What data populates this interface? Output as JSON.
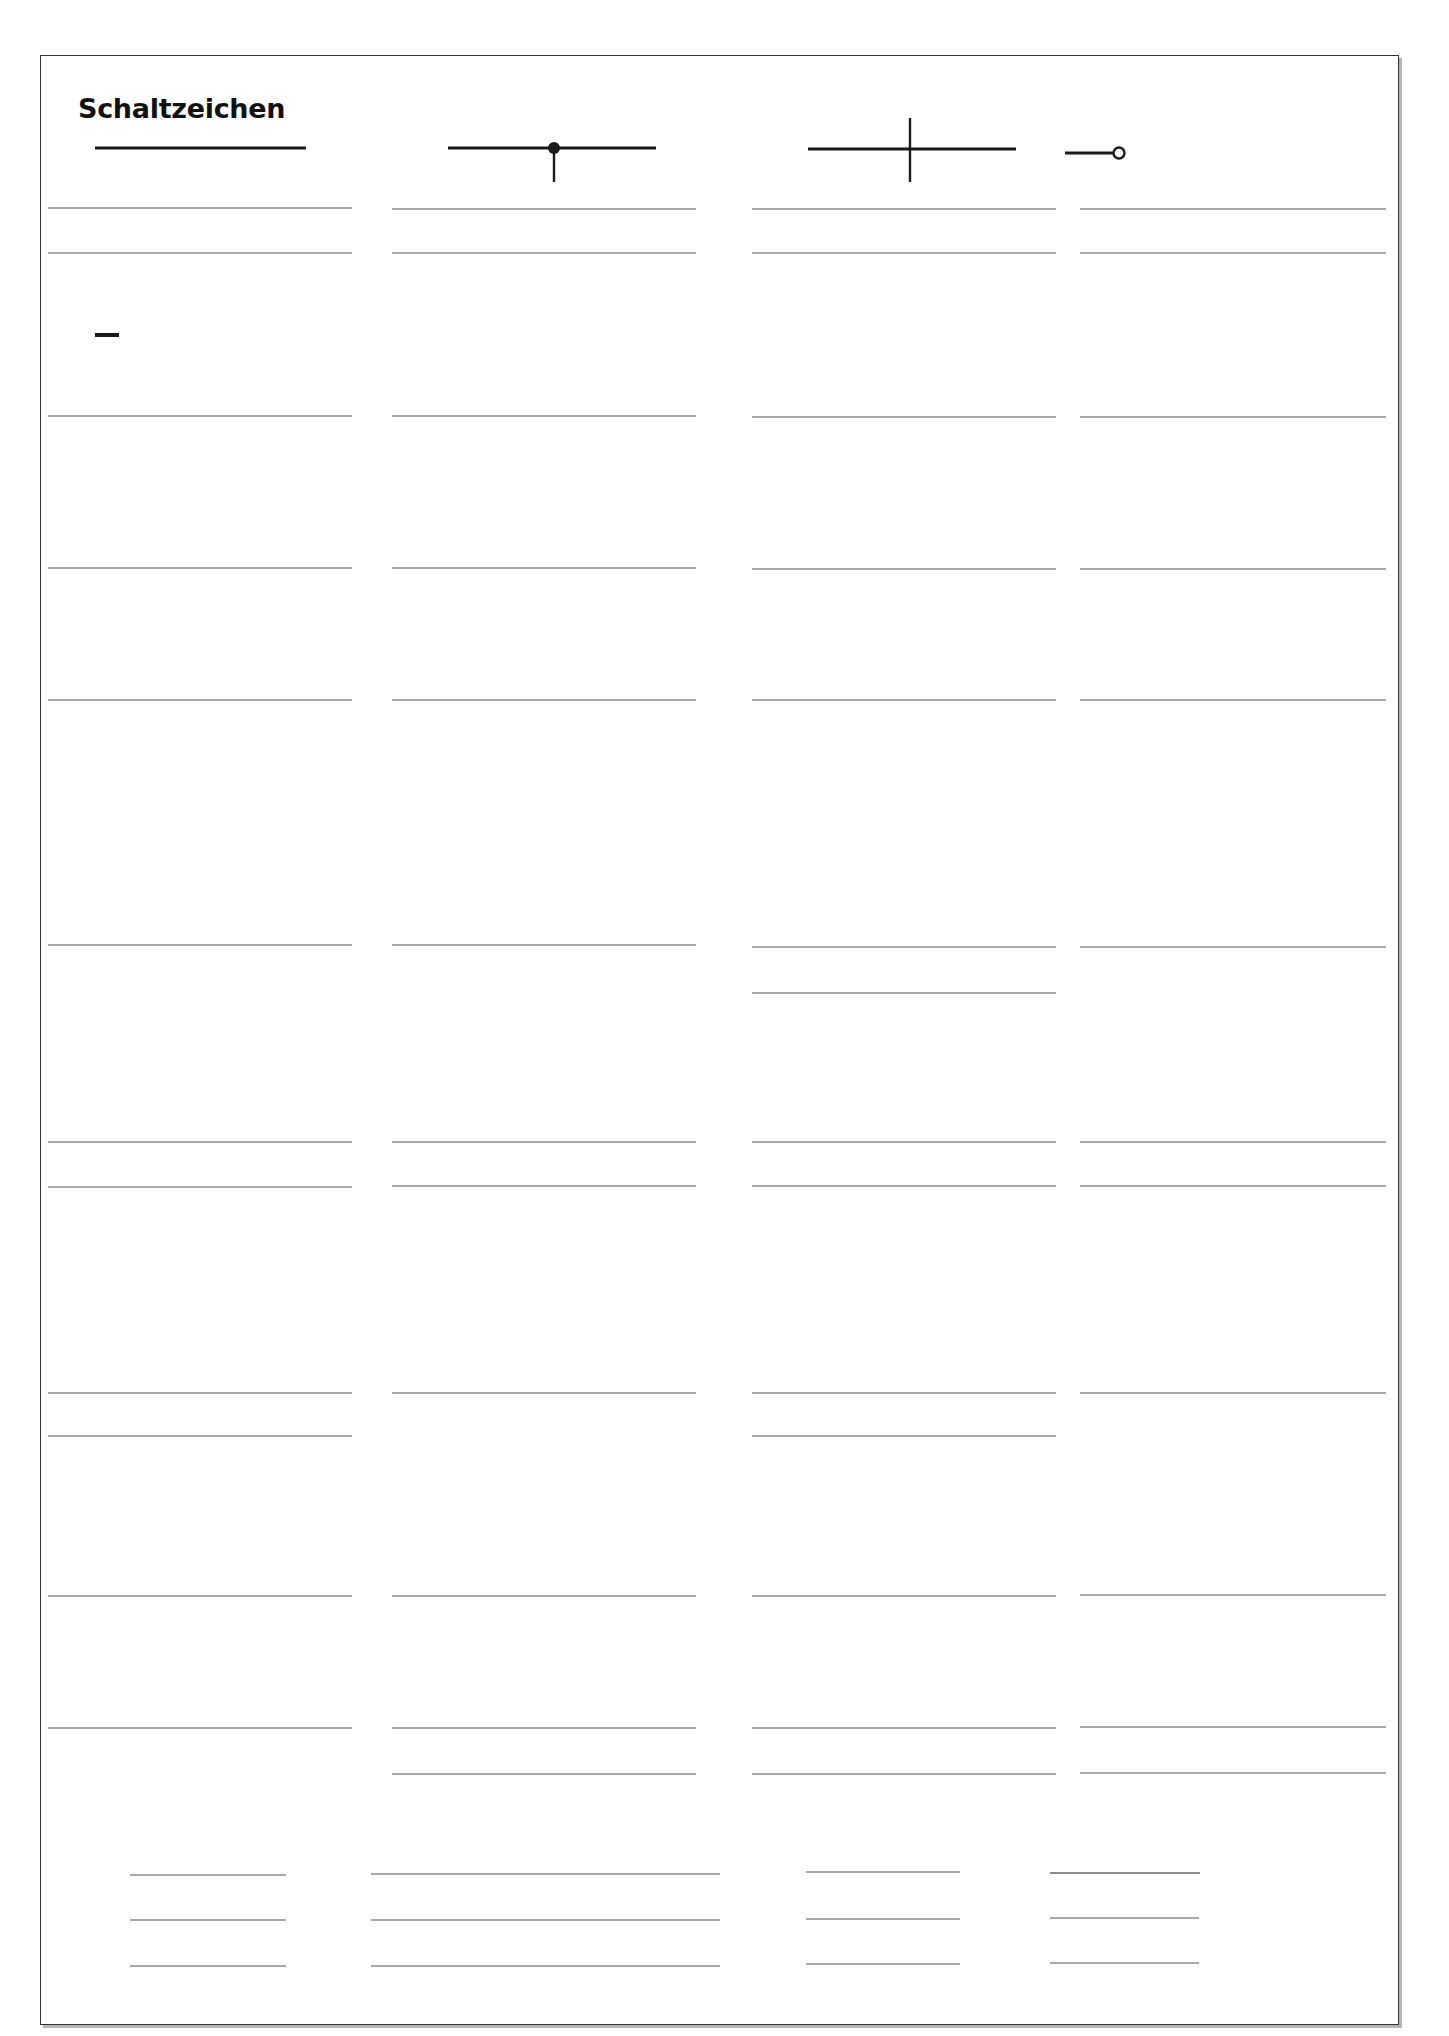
{
  "title": "Schaltzeichen",
  "colors": {
    "ink": "#1a1a1a",
    "rule": "#8c8c8c",
    "frame": "#333333",
    "shadow": "#b5b5b5",
    "paper": "#ffffff"
  },
  "grid": {
    "columns": 4,
    "rows": 11
  },
  "symbols": [
    {
      "row": 1,
      "col": 1,
      "symbol": "wire-conductor-icon",
      "marks": ""
    },
    {
      "row": 1,
      "col": 2,
      "symbol": "junction-dot-icon",
      "marks": ""
    },
    {
      "row": 1,
      "col": 3,
      "symbol": "crossing-wires-icon",
      "marks": ""
    },
    {
      "row": 1,
      "col": 4,
      "symbol": "terminal-icon",
      "marks": ""
    },
    {
      "row": 2,
      "col": 1,
      "symbol": "dc-source-terminals-icon",
      "marks": "− +"
    },
    {
      "row": 2,
      "col": 2,
      "symbol": "ac-source-terminals-icon",
      "marks": "~"
    },
    {
      "row": 2,
      "col": 3,
      "symbol": "battery-cell-icon",
      "marks": "− +"
    },
    {
      "row": 2,
      "col": 4,
      "symbol": "solar-cell-icon",
      "marks": ""
    },
    {
      "row": 3,
      "col": 1,
      "symbol": "push-button-switch-icon",
      "marks": ""
    },
    {
      "row": 3,
      "col": 2,
      "symbol": "switch-icon",
      "marks": ""
    },
    {
      "row": 3,
      "col": 3,
      "symbol": "voltmeter-icon",
      "marks": "V"
    },
    {
      "row": 3,
      "col": 4,
      "symbol": "ammeter-icon",
      "marks": "A"
    },
    {
      "row": 4,
      "col": 1,
      "symbol": "ohmmeter-icon",
      "marks": "Ω"
    },
    {
      "row": 4,
      "col": 2,
      "symbol": "lamp-icon",
      "marks": ""
    },
    {
      "row": 4,
      "col": 3,
      "symbol": "generator-icon",
      "marks": "G"
    },
    {
      "row": 4,
      "col": 4,
      "symbol": "motor-icon",
      "marks": "M"
    },
    {
      "row": 5,
      "col": 1,
      "symbol": "relay-icon",
      "marks": ""
    },
    {
      "row": 5,
      "col": 2,
      "symbol": "solenoid-valve-icon",
      "marks": ""
    },
    {
      "row": 5,
      "col": 3,
      "symbol": "coil-iron-core-icon",
      "marks": ""
    },
    {
      "row": 5,
      "col": 4,
      "symbol": "transformer-icon",
      "marks": ""
    },
    {
      "row": 6,
      "col": 1,
      "symbol": "resistor-icon",
      "marks": ""
    },
    {
      "row": 6,
      "col": 2,
      "symbol": "variable-resistor-icon",
      "marks": ""
    },
    {
      "row": 6,
      "col": 3,
      "symbol": "ptc-thermistor-icon",
      "marks": ""
    },
    {
      "row": 6,
      "col": 4,
      "symbol": "ntc-thermistor-icon",
      "marks": ""
    },
    {
      "row": 7,
      "col": 1,
      "symbol": "ldr-photoresistor-icon",
      "marks": ""
    },
    {
      "row": 7,
      "col": 2,
      "symbol": "diode-icon",
      "marks": ""
    },
    {
      "row": 7,
      "col": 3,
      "symbol": "led-icon",
      "marks": ""
    },
    {
      "row": 7,
      "col": 4,
      "symbol": "fuse-icon",
      "marks": ""
    },
    {
      "row": 8,
      "col": 1,
      "symbol": "earpiece-icon",
      "marks": ""
    },
    {
      "row": 8,
      "col": 2,
      "symbol": "loudspeaker-icon",
      "marks": ""
    },
    {
      "row": 8,
      "col": 3,
      "symbol": "microphone-icon",
      "marks": ""
    },
    {
      "row": 8,
      "col": 4,
      "symbol": "bell-icon",
      "marks": ""
    },
    {
      "row": 9,
      "col": 1,
      "symbol": "capacitor-icon",
      "marks": ""
    },
    {
      "row": 9,
      "col": 2,
      "symbol": "electrolytic-capacitor-icon",
      "marks": "+"
    },
    {
      "row": 9,
      "col": 3,
      "symbol": "polarized-capacitor-icon",
      "marks": "+"
    },
    {
      "row": 9,
      "col": 4,
      "symbol": "variable-capacitor-icon",
      "marks": ""
    },
    {
      "row": 10,
      "col": 1,
      "symbol": "npn-transistor-icon",
      "marks": ""
    },
    {
      "row": 10,
      "col": 2,
      "symbol": "pnp-transistor-icon",
      "marks": ""
    },
    {
      "row": 10,
      "col": 3,
      "symbol": "igbt-transistor-icon",
      "marks": ""
    },
    {
      "row": 10,
      "col": 4,
      "symbol": "phototransistor-icon",
      "marks": ""
    }
  ],
  "answer_fields": {
    "label_lines_per_cell": 2,
    "transistor_lines_per_symbol": 3,
    "values": []
  }
}
